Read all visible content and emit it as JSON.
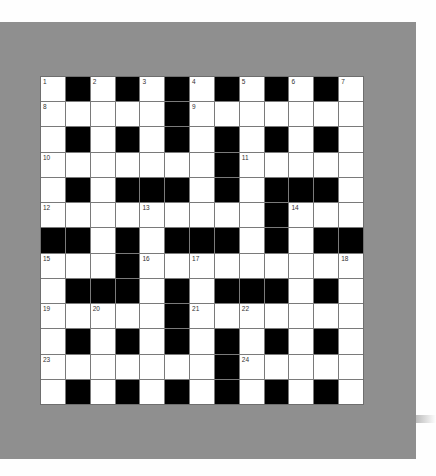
{
  "puzzle": {
    "type": "crossword",
    "rows": 13,
    "cols": 13,
    "colors": {
      "frame": "#8f8f8f",
      "block": "#000000",
      "cell": "#ffffff",
      "gridline": "#7a7a7a"
    },
    "layout": [
      ".#.#.#.#.#.#.",
      ".....#.......",
      ".#.#.#.#.#.#.",
      ".......#.....",
      ".#.###.#.###.",
      ".........#...",
      "##.#.###.#.##",
      "...#.........",
      ".###.#.###.#.",
      ".....#.......",
      ".#.#.#.#.#.#.",
      ".......#.....",
      ".#.#.#.#.#.#."
    ],
    "numbers": [
      {
        "n": "1",
        "r": 0,
        "c": 0
      },
      {
        "n": "2",
        "r": 0,
        "c": 2
      },
      {
        "n": "3",
        "r": 0,
        "c": 4
      },
      {
        "n": "4",
        "r": 0,
        "c": 6
      },
      {
        "n": "5",
        "r": 0,
        "c": 8
      },
      {
        "n": "6",
        "r": 0,
        "c": 10
      },
      {
        "n": "7",
        "r": 0,
        "c": 12
      },
      {
        "n": "8",
        "r": 1,
        "c": 0
      },
      {
        "n": "9",
        "r": 1,
        "c": 6
      },
      {
        "n": "10",
        "r": 3,
        "c": 0
      },
      {
        "n": "11",
        "r": 3,
        "c": 8
      },
      {
        "n": "12",
        "r": 5,
        "c": 0
      },
      {
        "n": "13",
        "r": 5,
        "c": 4
      },
      {
        "n": "14",
        "r": 5,
        "c": 10
      },
      {
        "n": "15",
        "r": 7,
        "c": 0
      },
      {
        "n": "16",
        "r": 7,
        "c": 4
      },
      {
        "n": "17",
        "r": 7,
        "c": 6
      },
      {
        "n": "18",
        "r": 7,
        "c": 12
      },
      {
        "n": "19",
        "r": 9,
        "c": 0
      },
      {
        "n": "20",
        "r": 9,
        "c": 2
      },
      {
        "n": "21",
        "r": 9,
        "c": 6
      },
      {
        "n": "22",
        "r": 9,
        "c": 8
      },
      {
        "n": "23",
        "r": 11,
        "c": 0
      },
      {
        "n": "24",
        "r": 11,
        "c": 8
      }
    ]
  }
}
